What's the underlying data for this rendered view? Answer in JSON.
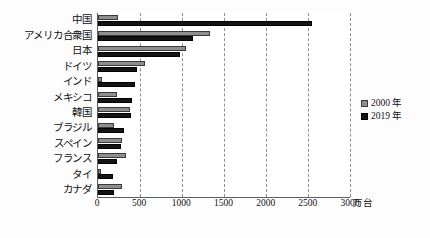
{
  "chart_data": {
    "type": "bar",
    "orientation": "horizontal",
    "title": "",
    "subtitle": "",
    "xlabel": "万台",
    "ylabel": "",
    "xlim": [
      0,
      3000
    ],
    "xticks": [
      0,
      500,
      1000,
      1500,
      2000,
      2500,
      3000
    ],
    "xtick_labels": [
      "0",
      "500",
      "1000",
      "1500",
      "2000",
      "2500",
      "3000"
    ],
    "grid": "vertical-dashed",
    "legend_position": "right",
    "categories": [
      "中国",
      "アメリカ合衆国",
      "日本",
      "ドイツ",
      "インド",
      "メキシコ",
      "韓国",
      "ブラジル",
      "スペイン",
      "フランス",
      "タイ",
      "カナダ"
    ],
    "series": [
      {
        "name": "2000 年",
        "color": "#8e8e8e",
        "values": [
          240,
          1330,
          1045,
          560,
          50,
          225,
          385,
          190,
          280,
          330,
          40,
          280
        ]
      },
      {
        "name": "2019 年",
        "color": "#141414",
        "values": [
          2550,
          1130,
          975,
          470,
          440,
          405,
          395,
          310,
          270,
          230,
          180,
          190
        ]
      }
    ]
  },
  "axis": {
    "unit_label": "万台"
  },
  "legend": {
    "items": [
      {
        "label": "2000 年"
      },
      {
        "label": "2019 年"
      }
    ]
  }
}
